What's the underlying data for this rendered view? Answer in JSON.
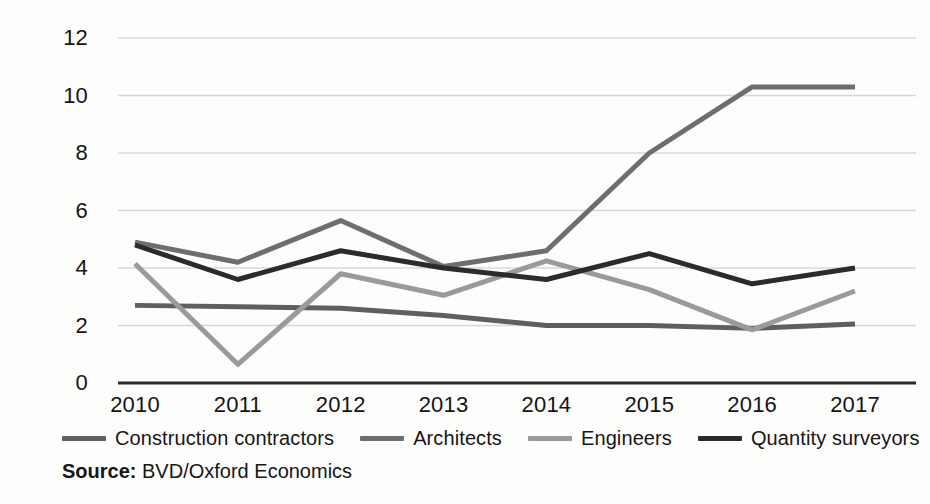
{
  "chart_data": {
    "type": "line",
    "title": "",
    "subtitle": "",
    "xlabel": "",
    "ylabel": "",
    "categories": [
      "2010",
      "2011",
      "2012",
      "2013",
      "2014",
      "2015",
      "2016",
      "2017"
    ],
    "x": [
      2010,
      2011,
      2012,
      2013,
      2014,
      2015,
      2016,
      2017
    ],
    "ylim": [
      0,
      12
    ],
    "yticks": [
      0,
      2,
      4,
      6,
      8,
      10,
      12
    ],
    "grid": true,
    "legend_position": "bottom",
    "series": [
      {
        "name": "Construction contractors",
        "color": "#5f5f5f",
        "values": [
          2.7,
          2.65,
          2.6,
          2.35,
          2.0,
          2.0,
          1.9,
          2.05
        ]
      },
      {
        "name": "Architects",
        "color": "#6e6e6e",
        "values": [
          4.9,
          4.2,
          5.65,
          4.05,
          4.6,
          8.0,
          10.3,
          10.3
        ]
      },
      {
        "name": "Engineers",
        "color": "#9a9a9a",
        "values": [
          4.15,
          0.65,
          3.8,
          3.05,
          4.25,
          3.25,
          1.85,
          3.2
        ]
      },
      {
        "name": "Quantity surveyors",
        "color": "#2b2b2b",
        "values": [
          4.8,
          3.6,
          4.6,
          4.0,
          3.6,
          4.5,
          3.45,
          4.0
        ]
      }
    ],
    "source_prefix": "Source:",
    "source_text": "BVD/Oxford Economics"
  },
  "axis": {
    "y_tick_labels": [
      "12",
      "10",
      "8",
      "6",
      "4",
      "2",
      "0"
    ],
    "x_tick_labels": [
      "2010",
      "2011",
      "2012",
      "2013",
      "2014",
      "2015",
      "2016",
      "2017"
    ]
  },
  "style": {
    "gridline_color": "#d8d8d8",
    "axis_color": "#2b2b2b",
    "background": "#fdfdfc"
  }
}
